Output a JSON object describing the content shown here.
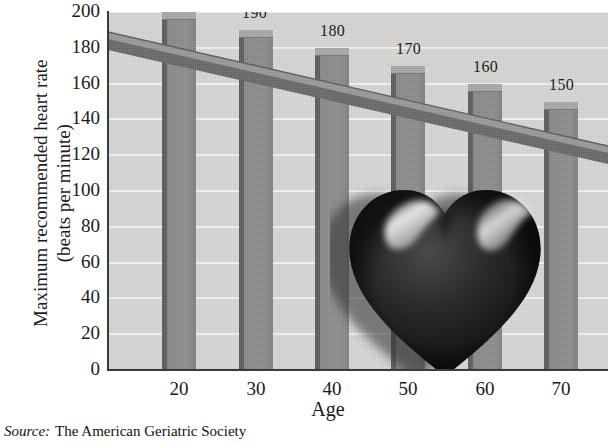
{
  "figure": {
    "source_prefix": "Source:",
    "source_text": "The American Geriatric Society"
  },
  "chart_data": {
    "type": "bar",
    "title": "",
    "xlabel": "Age",
    "ylabel_line1": "Maximum recommended heart rate",
    "ylabel_line2": "(beats per minute)",
    "categories": [
      "20",
      "30",
      "40",
      "50",
      "60",
      "70"
    ],
    "values": [
      200,
      190,
      180,
      170,
      160,
      150
    ],
    "data_labels": [
      "200",
      "190",
      "180",
      "170",
      "160",
      "150"
    ],
    "ylim": [
      0,
      200
    ],
    "ytick_step": 20,
    "yticks": [
      "0",
      "20",
      "40",
      "60",
      "80",
      "100",
      "120",
      "140",
      "160",
      "180",
      "200"
    ],
    "xticks": [
      "20",
      "30",
      "40",
      "50",
      "60",
      "70"
    ],
    "grid": true,
    "legend": "none",
    "series": [
      {
        "name": "Maximum recommended heart rate",
        "values": [
          200,
          190,
          180,
          170,
          160,
          150
        ]
      }
    ],
    "trendline": {
      "present": true,
      "description": "declining 3-D ribbon connecting bar tops",
      "start_value": 207,
      "end_value": 143
    },
    "colors": {
      "plot_background": "#d8d8d6",
      "gridline": "#f4f4f2",
      "bar_face": "#8b8b8b",
      "bar_edge": "#5e5e5e",
      "bar_top": "#a9a9a9",
      "axis": "#3b3b3b",
      "text": "#1a1a1a",
      "heart": "#1b1b1b"
    },
    "decoration": {
      "graphic": "heart-illustration"
    }
  }
}
